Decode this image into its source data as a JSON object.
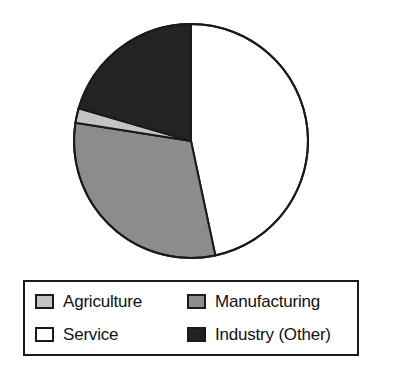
{
  "chart_data": {
    "type": "pie",
    "title": "",
    "subtitle": "",
    "xlabel": "",
    "ylabel": "",
    "grid": false,
    "legend_position": "bottom",
    "start_angle_deg": 0,
    "direction": "clockwise",
    "categories": [
      "Service",
      "Manufacturing",
      "Agriculture",
      "Industry (Other)"
    ],
    "values": [
      46.7,
      30.8,
      2.0,
      20.5
    ],
    "units": "percent",
    "slices": [
      {
        "label": "Service",
        "value": 46.7,
        "color": "#ffffff",
        "start_angle_deg": 0,
        "end_angle_deg": 168,
        "swatch_name": "swatch-service"
      },
      {
        "label": "Manufacturing",
        "value": 30.8,
        "color": "#8c8c8c",
        "start_angle_deg": 168,
        "end_angle_deg": 279,
        "swatch_name": "swatch-manufacturing"
      },
      {
        "label": "Agriculture",
        "value": 2.0,
        "color": "#c4c4c4",
        "start_angle_deg": 279,
        "end_angle_deg": 286.2,
        "swatch_name": "swatch-agriculture"
      },
      {
        "label": "Industry (Other)",
        "value": 20.5,
        "color": "#232323",
        "start_angle_deg": 286.2,
        "end_angle_deg": 360,
        "swatch_name": "swatch-industry"
      }
    ]
  },
  "pie": {
    "center_x": 191,
    "center_y": 141,
    "radius": 117,
    "outline_color": "#1a1a1a",
    "outline_width": 2
  },
  "legend": {
    "border_color": "#1a1a1a",
    "background": "#ffffff",
    "entries": [
      {
        "label": "Agriculture",
        "color": "#c4c4c4"
      },
      {
        "label": "Manufacturing",
        "color": "#8c8c8c"
      },
      {
        "label": "Service",
        "color": "#ffffff"
      },
      {
        "label": "Industry (Other)",
        "color": "#232323"
      }
    ]
  }
}
